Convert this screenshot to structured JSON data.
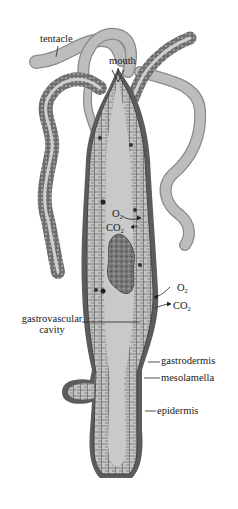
{
  "figure": {
    "colors": {
      "body_fill": "#b8b8b8",
      "cavity_fill": "#c9c9c9",
      "cell_stroke": "#4a4a4a",
      "epidermis_dark": "#5a5a5a",
      "tentacle_fill": "#bdbdbd",
      "food_mass": "#707070",
      "label_text": "#1a1a1a"
    }
  },
  "labels": {
    "tentacle": "tentacle",
    "mouth": "mouth",
    "o2_inner": "O",
    "o2_inner_sub": "2",
    "co2_inner": "CO",
    "co2_inner_sub": "2",
    "o2_outer": "O",
    "o2_outer_sub": "2",
    "co2_outer": "CO",
    "co2_outer_sub": "2",
    "gastrovascular_line1": "gastrovascular",
    "gastrovascular_line2": "cavity",
    "gastrodermis": "gastrodermis",
    "mesolamella": "mesolamella",
    "epidermis": "epidermis"
  }
}
